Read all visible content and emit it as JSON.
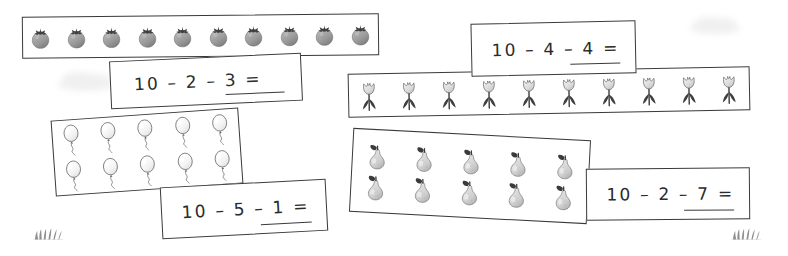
{
  "worksheet": {
    "background_color": "#ffffff",
    "ink_color": "#3a3a3a",
    "text_color": "#2b2b2b"
  },
  "problems": [
    {
      "id": "strawberries",
      "icon": "strawberry-icon",
      "equation": "10 – 2 – 3 =",
      "answer": "",
      "total_items": 10,
      "rows": 1,
      "per_row": 10,
      "minuend": 10,
      "subtrahends": [
        2,
        3
      ]
    },
    {
      "id": "tulips",
      "icon": "tulip-icon",
      "equation": "10 – 4 – 4 =",
      "answer": "",
      "total_items": 10,
      "rows": 1,
      "per_row": 10,
      "minuend": 10,
      "subtrahends": [
        4,
        4
      ]
    },
    {
      "id": "balloons",
      "icon": "balloon-icon",
      "equation": "10 – 5 – 1 =",
      "answer": "",
      "total_items": 10,
      "rows": 2,
      "per_row": 5,
      "minuend": 10,
      "subtrahends": [
        5,
        1
      ]
    },
    {
      "id": "pears",
      "icon": "pear-icon",
      "equation": "10 – 2 – 7 =",
      "answer": "",
      "total_items": 10,
      "rows": 2,
      "per_row": 5,
      "minuend": 10,
      "subtrahends": [
        2,
        7
      ]
    }
  ],
  "decorations": [
    {
      "id": "grass-left",
      "icon": "grass-tuft-icon"
    },
    {
      "id": "grass-right",
      "icon": "grass-tuft-icon"
    },
    {
      "id": "cloud-left",
      "icon": "cloud-icon"
    },
    {
      "id": "cloud-right",
      "icon": "cloud-icon"
    }
  ]
}
